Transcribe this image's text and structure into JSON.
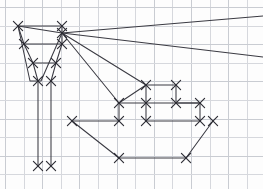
{
  "canvas": {
    "width": 263,
    "height": 189,
    "background_color": "#fdfdfd",
    "title": "graph-paper-line-drawing"
  },
  "grid": {
    "name": "graph-paper-grid",
    "spacing_px": 18.6,
    "origin_x": 5,
    "origin_y": 7,
    "color": "#d6d8dd",
    "major_color": "#c9ccd2",
    "vertical_count": 15,
    "horizontal_count": 11,
    "visible": true
  },
  "style": {
    "stroke_color": "#3a3a42",
    "vertex_color": "#2c2c34",
    "stroke_width": 1.05,
    "vertex_glyph": "x-cross",
    "vertex_size_px": 4.6
  },
  "shapes": [
    {
      "name": "sail-trapezoid-outline",
      "type": "polyline",
      "closed": false,
      "points": [
        [
          18,
          26
        ],
        [
          62,
          33
        ],
        [
          62,
          33
        ],
        [
          41,
          81
        ],
        [
          30,
          81
        ],
        [
          18,
          26
        ]
      ]
    },
    {
      "name": "sail-top-edge",
      "type": "polyline",
      "closed": false,
      "points": [
        [
          18,
          26
        ],
        [
          62,
          26
        ]
      ]
    },
    {
      "name": "sail-upper-crossbar",
      "type": "polyline",
      "closed": false,
      "points": [
        [
          24,
          44
        ],
        [
          62,
          44
        ]
      ]
    },
    {
      "name": "sail-lower-crossbar",
      "type": "polyline",
      "closed": false,
      "points": [
        [
          33,
          63
        ],
        [
          56,
          63
        ]
      ]
    },
    {
      "name": "sail-left-leg",
      "type": "polyline",
      "closed": false,
      "points": [
        [
          18,
          26
        ],
        [
          24,
          44
        ],
        [
          33,
          63
        ],
        [
          38,
          81
        ]
      ]
    },
    {
      "name": "sail-right-leg",
      "type": "polyline",
      "closed": false,
      "points": [
        [
          62,
          26
        ],
        [
          62,
          44
        ],
        [
          56,
          63
        ],
        [
          51,
          81
        ]
      ]
    },
    {
      "name": "mast-left-vertical",
      "type": "polyline",
      "closed": false,
      "points": [
        [
          38,
          81
        ],
        [
          38,
          166
        ]
      ]
    },
    {
      "name": "mast-right-vertical",
      "type": "polyline",
      "closed": false,
      "points": [
        [
          51,
          81
        ],
        [
          51,
          166
        ]
      ]
    },
    {
      "name": "hull-deck-and-prow",
      "type": "polyline",
      "closed": false,
      "points": [
        [
          72,
          121
        ],
        [
          119,
          121
        ],
        [
          119,
          103
        ],
        [
          146,
          103
        ],
        [
          146,
          121
        ],
        [
          200,
          121
        ],
        [
          200,
          103
        ],
        [
          176,
          103
        ],
        [
          176,
          85
        ],
        [
          146,
          85
        ],
        [
          146,
          103
        ]
      ]
    },
    {
      "name": "hull-port-diagonal",
      "type": "polyline",
      "closed": false,
      "points": [
        [
          72,
          121
        ],
        [
          119,
          158
        ]
      ]
    },
    {
      "name": "hull-bottom-edge",
      "type": "polyline",
      "closed": false,
      "points": [
        [
          119,
          158
        ],
        [
          186,
          158
        ]
      ]
    },
    {
      "name": "hull-starboard-diagonal",
      "type": "polyline",
      "closed": false,
      "points": [
        [
          186,
          158
        ],
        [
          213,
          121
        ]
      ]
    },
    {
      "name": "hull-upper-step",
      "type": "polyline",
      "closed": false,
      "points": [
        [
          146,
          103
        ],
        [
          200,
          103
        ]
      ]
    },
    {
      "name": "hull-cabin-top",
      "type": "polyline",
      "closed": false,
      "points": [
        [
          119,
          103
        ],
        [
          146,
          85
        ]
      ]
    }
  ],
  "rays": {
    "name": "perspective-ray-bundle",
    "hub": [
      62,
      33
    ],
    "lines": [
      {
        "name": "ray-upper-right",
        "to": [
          263,
          16
        ]
      },
      {
        "name": "ray-mid-right",
        "to": [
          263,
          57
        ]
      },
      {
        "name": "ray-to-cabin-peak",
        "to": [
          146,
          85
        ]
      },
      {
        "name": "ray-to-hull-step",
        "to": [
          119,
          103
        ]
      }
    ]
  },
  "vertices": [
    {
      "name": "vertex-sail-top-left",
      "x": 18,
      "y": 26
    },
    {
      "name": "vertex-sail-top-right",
      "x": 62,
      "y": 26
    },
    {
      "name": "vertex-sail-upper-left",
      "x": 24,
      "y": 44
    },
    {
      "name": "vertex-hub",
      "x": 62,
      "y": 33
    },
    {
      "name": "vertex-sail-mid-right",
      "x": 62,
      "y": 44
    },
    {
      "name": "vertex-sail-lower-left",
      "x": 33,
      "y": 63
    },
    {
      "name": "vertex-sail-lower-right",
      "x": 56,
      "y": 63
    },
    {
      "name": "vertex-mast-left-top",
      "x": 38,
      "y": 81
    },
    {
      "name": "vertex-mast-right-top",
      "x": 51,
      "y": 81
    },
    {
      "name": "vertex-mast-left-bottom",
      "x": 38,
      "y": 166
    },
    {
      "name": "vertex-mast-right-bottom",
      "x": 51,
      "y": 166
    },
    {
      "name": "vertex-hull-deck-left",
      "x": 72,
      "y": 121
    },
    {
      "name": "vertex-hull-cabin-left",
      "x": 119,
      "y": 121
    },
    {
      "name": "vertex-hull-cabin-left-top",
      "x": 119,
      "y": 103
    },
    {
      "name": "vertex-hull-cabin-peak",
      "x": 146,
      "y": 85
    },
    {
      "name": "vertex-hull-cabin-right-top",
      "x": 176,
      "y": 85
    },
    {
      "name": "vertex-hull-cabin-mid",
      "x": 146,
      "y": 103
    },
    {
      "name": "vertex-hull-step-right",
      "x": 200,
      "y": 103
    },
    {
      "name": "vertex-hull-cabin-right",
      "x": 176,
      "y": 103
    },
    {
      "name": "vertex-hull-deck-right",
      "x": 213,
      "y": 121
    },
    {
      "name": "vertex-hull-bottom-left",
      "x": 119,
      "y": 158
    },
    {
      "name": "vertex-hull-bottom-right",
      "x": 186,
      "y": 158
    },
    {
      "name": "vertex-hull-mid-right",
      "x": 200,
      "y": 121
    },
    {
      "name": "vertex-hull-mid-left",
      "x": 146,
      "y": 121
    }
  ]
}
